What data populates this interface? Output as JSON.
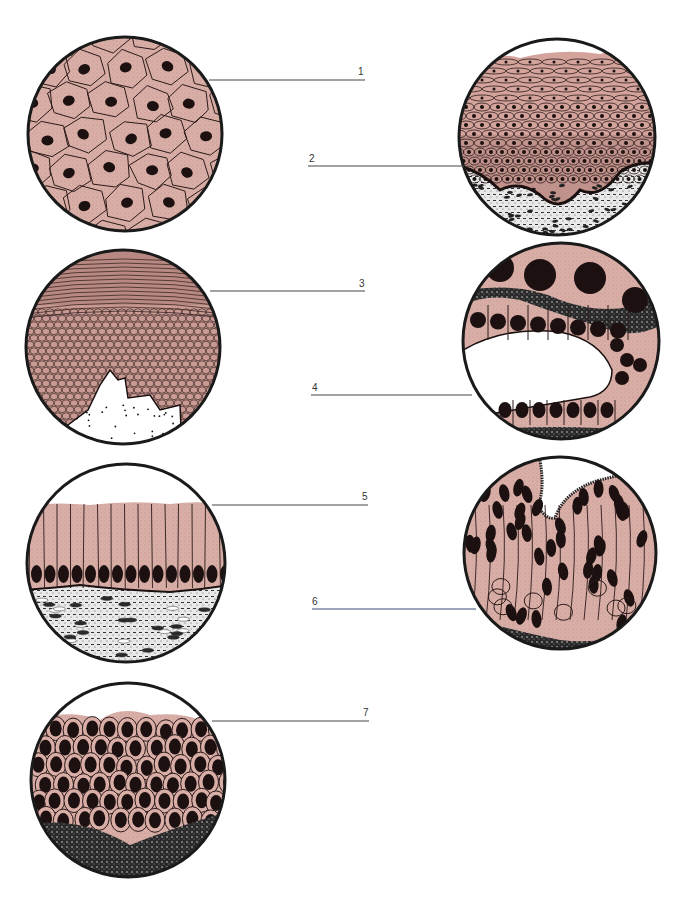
{
  "diagram": {
    "colors": {
      "cytoplasm": "#d9aea6",
      "cytoplasm_dark": "#c9968f",
      "nucleus": "#1c1010",
      "connective": "#e6e6e6",
      "background": "#ffffff"
    },
    "panels": [
      {
        "id": 1,
        "label": "1",
        "description": "Simple squamous epithelium (surface view)"
      },
      {
        "id": 2,
        "label": "2",
        "description": "Stratified squamous epithelium (non-keratinized)"
      },
      {
        "id": 3,
        "label": "3",
        "description": "Stratified squamous epithelium (keratinized)"
      },
      {
        "id": 4,
        "label": "4",
        "description": "Simple cuboidal epithelium"
      },
      {
        "id": 5,
        "label": "5",
        "description": "Simple columnar epithelium"
      },
      {
        "id": 6,
        "label": "6",
        "description": "Pseudostratified ciliated columnar epithelium"
      },
      {
        "id": 7,
        "label": "7",
        "description": "Transitional epithelium"
      }
    ]
  }
}
